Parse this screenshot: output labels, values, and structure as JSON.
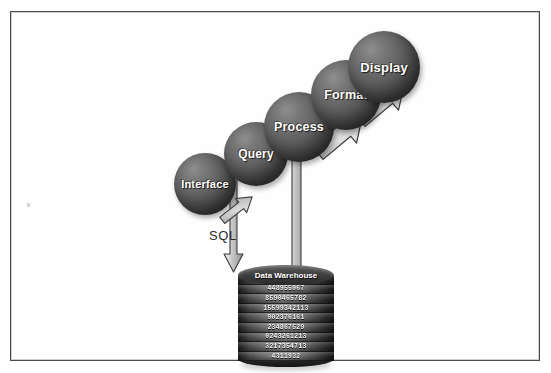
{
  "diagram": {
    "type": "flow-diagram",
    "frame": {
      "border_color": "#4a4a4a",
      "background": "#ffffff"
    },
    "palette": {
      "sphere_light": "#8e8e8e",
      "sphere_dark": "#2e2e2e",
      "arrow_fill": "#b9b9b9",
      "arrow_outline": "#3a3a3a",
      "label_text": "#ffffff",
      "body_text": "#2b2b2b"
    },
    "stages": [
      {
        "id": "interface",
        "label": "Interface",
        "order": 1
      },
      {
        "id": "query",
        "label": "Query",
        "order": 2
      },
      {
        "id": "process",
        "label": "Process",
        "order": 3
      },
      {
        "id": "format",
        "label": "Format",
        "order": 4
      },
      {
        "id": "display",
        "label": "Display",
        "order": 5
      }
    ],
    "labels": {
      "sql": "SQL",
      "warehouse": "Data Warehouse"
    },
    "arrows": [
      {
        "id": "to-interface",
        "direction": "up-right",
        "style": "small-diagonal"
      },
      {
        "id": "interface-to-warehouse",
        "direction": "down",
        "style": "long-vertical",
        "annotation": "SQL"
      },
      {
        "id": "warehouse-to-process",
        "direction": "up",
        "style": "long-vertical"
      },
      {
        "id": "process-to-format",
        "direction": "up-right",
        "style": "block-diagonal"
      },
      {
        "id": "format-to-display",
        "direction": "up-right",
        "style": "block-diagonal"
      }
    ],
    "warehouse_rows": [
      "0202489553",
      "448955067",
      "8590465782",
      "15599342113",
      "902376161",
      "234867529",
      "0243261213",
      "3217354713",
      "4311932"
    ]
  }
}
